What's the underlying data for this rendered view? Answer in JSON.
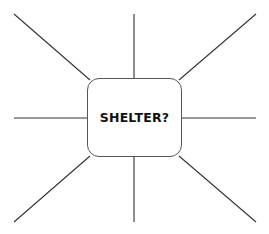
{
  "diagram": {
    "type": "spider-map",
    "center": {
      "label": "SHELTER?"
    },
    "spokes": [
      {
        "name": "top-left"
      },
      {
        "name": "top"
      },
      {
        "name": "top-right"
      },
      {
        "name": "left"
      },
      {
        "name": "right"
      },
      {
        "name": "bottom-left"
      },
      {
        "name": "bottom"
      },
      {
        "name": "bottom-right"
      }
    ],
    "colors": {
      "line": "#333333",
      "box_border": "#555555",
      "text": "#111111",
      "background": "#ffffff"
    }
  }
}
